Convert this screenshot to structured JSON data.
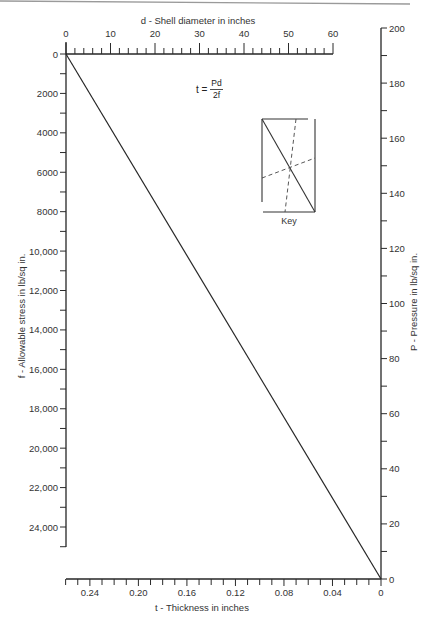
{
  "page": {
    "formula": {
      "lhs": "t =",
      "numerator": "Pd",
      "denominator": "2f"
    },
    "key_label": "Key"
  },
  "chart_data": {
    "type": "line",
    "axes": {
      "d": {
        "label": "d - Shell diameter in inches",
        "position": "top",
        "range": [
          0,
          60
        ],
        "minor_step": 2,
        "tick_values": [
          0,
          10,
          20,
          30,
          40,
          50,
          60
        ],
        "tick_labels": [
          "0",
          "10",
          "20",
          "30",
          "40",
          "50",
          "60"
        ]
      },
      "f": {
        "label": "f - Allowable stress in lb/sq in.",
        "position": "left",
        "range": [
          0,
          25000
        ],
        "minor_step": 1000,
        "tick_values": [
          0,
          2000,
          4000,
          6000,
          8000,
          10000,
          12000,
          14000,
          16000,
          18000,
          20000,
          22000,
          24000
        ],
        "tick_labels": [
          "0",
          "2000",
          "4000",
          "6000",
          "8000",
          "10,000",
          "12,000",
          "14,000",
          "16,000",
          "18,000",
          "20,000",
          "22,000",
          "24,000"
        ]
      },
      "P": {
        "label": "P - Pressure in lb/sq in.",
        "position": "right",
        "range": [
          0,
          200
        ],
        "minor_step": 10,
        "tick_values": [
          0,
          20,
          40,
          60,
          80,
          100,
          120,
          140,
          160,
          180,
          200
        ],
        "tick_labels": [
          "0",
          "20",
          "40",
          "60",
          "80",
          "100",
          "120",
          "140",
          "160",
          "180",
          "200"
        ]
      },
      "t": {
        "label": "t - Thickness in inches",
        "position": "bottom",
        "range": [
          0,
          0.26
        ],
        "reversed": true,
        "minor_step": 0.01,
        "tick_values": [
          0,
          0.04,
          0.08,
          0.12,
          0.16,
          0.2,
          0.24
        ],
        "tick_labels": [
          "0",
          "0.04",
          "0.08",
          "0.12",
          "0.16",
          "0.20",
          "0.24"
        ]
      }
    },
    "series": [
      {
        "name": "index-line",
        "from": {
          "d": 0,
          "f": 0
        },
        "to": {
          "P": 0,
          "t": 0
        }
      }
    ],
    "legend": {
      "label": "Key",
      "placement": "upper-right-inside"
    },
    "grid": false
  }
}
